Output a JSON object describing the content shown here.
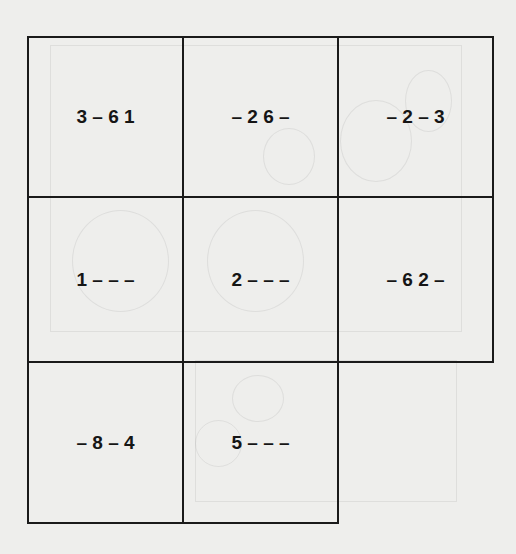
{
  "puzzle": {
    "cells": [
      {
        "row": 0,
        "col": 0,
        "code": "3 – 6 1"
      },
      {
        "row": 0,
        "col": 1,
        "code": "– 2 6 –"
      },
      {
        "row": 0,
        "col": 2,
        "code": "– 2 – 3"
      },
      {
        "row": 1,
        "col": 0,
        "code": "1 – – –"
      },
      {
        "row": 1,
        "col": 1,
        "code": "2 – – –"
      },
      {
        "row": 1,
        "col": 2,
        "code": "– 6 2 –"
      },
      {
        "row": 2,
        "col": 0,
        "code": "– 8 – 4"
      },
      {
        "row": 2,
        "col": 1,
        "code": "5 – – –"
      }
    ],
    "empty_cell": {
      "row": 2,
      "col": 2
    }
  },
  "colors": {
    "background": "#eeeeec",
    "grid_line": "#1a1a1a",
    "text": "#151515"
  }
}
